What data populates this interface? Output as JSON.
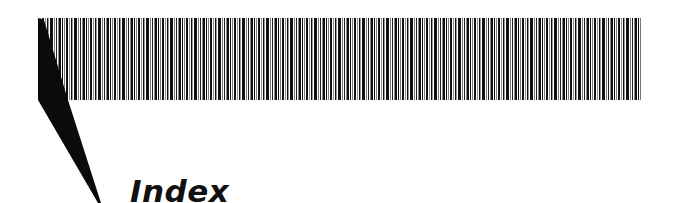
{
  "page": {
    "title": "Index"
  },
  "decoration": {
    "barcode_band": "striped-header-band",
    "wedge": "black-pointer-wedge"
  },
  "colors": {
    "ink": "#111111",
    "background": "#ffffff",
    "stripe_gray": "#888888"
  }
}
